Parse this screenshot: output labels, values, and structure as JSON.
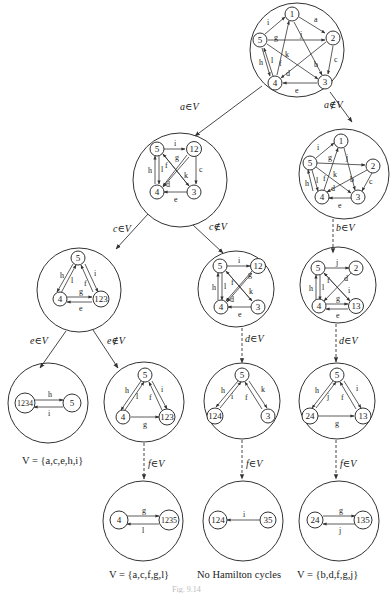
{
  "figure": {
    "root": {
      "nodes": [
        "1",
        "2",
        "3",
        "4",
        "5"
      ],
      "edges": [
        "a",
        "b",
        "c",
        "d",
        "e",
        "f",
        "g",
        "h",
        "i",
        "j",
        "k",
        "l"
      ]
    },
    "branches": {
      "a_in": "a∈V",
      "a_out": "a∉V",
      "c_in": "c∈V",
      "c_out": "c∉V",
      "b_in": "b∈V",
      "d_in_mid": "d∈V",
      "d_in_right": "d∈V",
      "e_in": "e∈V",
      "e_out": "e∉V",
      "f_in_1": "f∈V",
      "f_in_2": "f∈V",
      "f_in_3": "f∈V"
    },
    "level1_left": {
      "nodes": [
        "5",
        "12",
        "4",
        "3"
      ],
      "edges": [
        "i",
        "g",
        "c",
        "h",
        "l",
        "f",
        "k",
        "d",
        "e"
      ]
    },
    "level1_right": {
      "nodes": [
        "1",
        "2",
        "3",
        "4",
        "5"
      ],
      "edges": [
        "i",
        "g",
        "j",
        "k",
        "b",
        "c",
        "h",
        "l",
        "f",
        "d",
        "e"
      ]
    },
    "level2_left": {
      "nodes": [
        "5",
        "4",
        "123"
      ],
      "edges": [
        "h",
        "l",
        "f",
        "i",
        "g",
        "e"
      ]
    },
    "level2_mid": {
      "nodes": [
        "5",
        "12",
        "4",
        "3"
      ],
      "edges": [
        "i",
        "g",
        "h",
        "l",
        "f",
        "k",
        "d",
        "e"
      ]
    },
    "level2_right": {
      "nodes": [
        "5",
        "2",
        "4",
        "13"
      ],
      "edges": [
        "j",
        "d",
        "h",
        "l",
        "f",
        "i",
        "g",
        "e"
      ]
    },
    "level3_a": {
      "nodes": [
        "1234",
        "5"
      ],
      "edges": [
        "h",
        "i"
      ]
    },
    "level3_b": {
      "nodes": [
        "5",
        "4",
        "123"
      ],
      "edges": [
        "h",
        "l",
        "f",
        "i",
        "g"
      ]
    },
    "level3_c": {
      "nodes": [
        "5",
        "124",
        "3"
      ],
      "edges": [
        "h",
        "i",
        "f",
        "k"
      ]
    },
    "level3_d": {
      "nodes": [
        "5",
        "24",
        "13"
      ],
      "edges": [
        "h",
        "j",
        "f",
        "i",
        "g"
      ]
    },
    "level4_a": {
      "nodes": [
        "4",
        "1235"
      ],
      "edges": [
        "g",
        "l"
      ]
    },
    "level4_b": {
      "nodes": [
        "124",
        "35"
      ],
      "edges": [
        "i"
      ]
    },
    "level4_c": {
      "nodes": [
        "24",
        "135"
      ],
      "edges": [
        "g",
        "j"
      ]
    },
    "captions": {
      "c1": "V = {a,c,e,h,i}",
      "c2": "V = {a,c,f,g,l}",
      "c3": "No Hamilton cycles",
      "c4": "V = {b,d,f,g,j}"
    },
    "figure_label": "Fig. 9.14"
  }
}
